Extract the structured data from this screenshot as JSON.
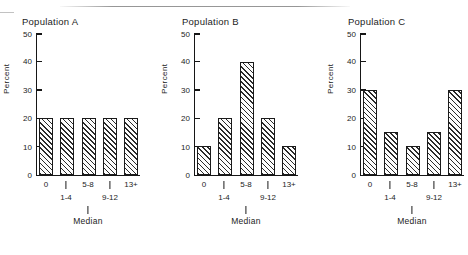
{
  "figure": {
    "panel_count": 3,
    "ylabel": "Percent",
    "median_label": "Median",
    "y_ticks": [
      "0",
      "10",
      "20",
      "30",
      "40",
      "50"
    ],
    "x_tick_labels": [
      "0",
      "1-4",
      "5-8",
      "9-12",
      "13+"
    ]
  },
  "chart_data": [
    {
      "type": "bar",
      "title": "Population A",
      "categories": [
        "0",
        "1-4",
        "5-8",
        "9-12",
        "13+"
      ],
      "values": [
        20,
        20,
        20,
        20,
        20
      ],
      "xlabel": "Median",
      "ylabel": "Percent",
      "ylim": [
        0,
        50
      ],
      "yticks": [
        0,
        10,
        20,
        30,
        40,
        50
      ],
      "grid": false,
      "legend": "none",
      "median_category": "5-8",
      "bar_style": "diagonal-hatch"
    },
    {
      "type": "bar",
      "title": "Population B",
      "categories": [
        "0",
        "1-4",
        "5-8",
        "9-12",
        "13+"
      ],
      "values": [
        10,
        20,
        40,
        20,
        10
      ],
      "xlabel": "Median",
      "ylabel": "Percent",
      "ylim": [
        0,
        50
      ],
      "yticks": [
        0,
        10,
        20,
        30,
        40,
        50
      ],
      "grid": false,
      "legend": "none",
      "median_category": "5-8",
      "bar_style": "diagonal-hatch"
    },
    {
      "type": "bar",
      "title": "Population C",
      "categories": [
        "0",
        "1-4",
        "5-8",
        "9-12",
        "13+"
      ],
      "values": [
        30,
        15,
        10,
        15,
        30
      ],
      "xlabel": "Median",
      "ylabel": "Percent",
      "ylim": [
        0,
        50
      ],
      "yticks": [
        0,
        10,
        20,
        30,
        40,
        50
      ],
      "grid": false,
      "legend": "none",
      "median_category": "5-8",
      "bar_style": "diagonal-hatch"
    }
  ],
  "colors": {
    "ink": "#161616",
    "background": "#ffffff",
    "hatch": "#2a2a2a"
  }
}
